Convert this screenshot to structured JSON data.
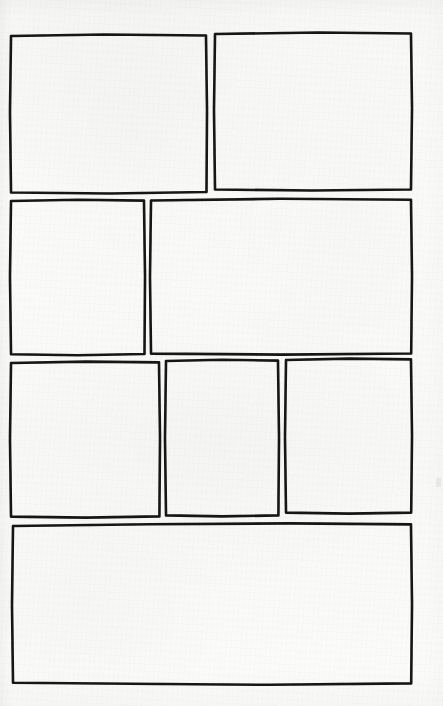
{
  "page": {
    "kind": "blank-comic-page-layout",
    "width": 443,
    "height": 706,
    "paper_color": "#fafaf9",
    "ink_color": "#151515",
    "media": "scanned paper, hand-inked panel borders",
    "panel_count": 8,
    "row_count": 4,
    "content_text": ""
  },
  "rows": [
    {
      "index": 1,
      "label": "Row 1",
      "panel_count": 2,
      "top": 35,
      "bottom": 193
    },
    {
      "index": 2,
      "label": "Row 2",
      "panel_count": 2,
      "top": 200,
      "bottom": 355
    },
    {
      "index": 3,
      "label": "Row 3",
      "panel_count": 3,
      "top": 361,
      "bottom": 517
    },
    {
      "index": 4,
      "label": "Row 4",
      "panel_count": 1,
      "top": 524,
      "bottom": 684
    }
  ],
  "panels": [
    {
      "id": "panel-1",
      "label": "Panel 1",
      "row": 1,
      "order_in_row": 1,
      "x": 10,
      "y": 35,
      "width": 197,
      "height": 158,
      "caption": "",
      "dialogue": ""
    },
    {
      "id": "panel-2",
      "label": "Panel 2",
      "row": 1,
      "order_in_row": 2,
      "x": 214,
      "y": 33,
      "width": 198,
      "height": 157,
      "caption": "",
      "dialogue": ""
    },
    {
      "id": "panel-3",
      "label": "Panel 3",
      "row": 2,
      "order_in_row": 1,
      "x": 10,
      "y": 200,
      "width": 135,
      "height": 155,
      "caption": "",
      "dialogue": ""
    },
    {
      "id": "panel-4",
      "label": "Panel 4",
      "row": 2,
      "order_in_row": 2,
      "x": 150,
      "y": 199,
      "width": 262,
      "height": 155,
      "caption": "",
      "dialogue": ""
    },
    {
      "id": "panel-5",
      "label": "Panel 5",
      "row": 3,
      "order_in_row": 1,
      "x": 10,
      "y": 362,
      "width": 150,
      "height": 155,
      "caption": "",
      "dialogue": ""
    },
    {
      "id": "panel-6",
      "label": "Panel 6",
      "row": 3,
      "order_in_row": 2,
      "x": 165,
      "y": 360,
      "width": 114,
      "height": 155,
      "caption": "",
      "dialogue": ""
    },
    {
      "id": "panel-7",
      "label": "Panel 7",
      "row": 3,
      "order_in_row": 3,
      "x": 285,
      "y": 359,
      "width": 127,
      "height": 153,
      "caption": "",
      "dialogue": ""
    },
    {
      "id": "panel-8",
      "label": "Panel 8",
      "row": 4,
      "order_in_row": 1,
      "x": 12,
      "y": 525,
      "width": 400,
      "height": 159,
      "caption": "",
      "dialogue": ""
    }
  ],
  "marks": [
    {
      "id": "margin-smudge-right",
      "label": "Ink smudge in right margin",
      "x": 436,
      "y": 478,
      "width": 5,
      "height": 9
    }
  ]
}
